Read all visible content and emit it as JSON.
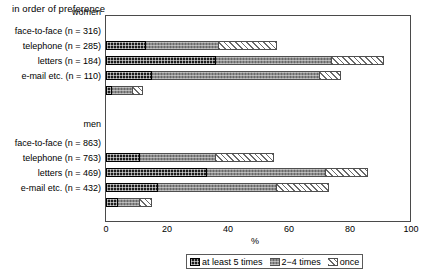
{
  "chart_title": "in order of preference",
  "xlabel": "%",
  "axis": {
    "ticks": [
      "0",
      "20",
      "40",
      "60",
      "80",
      "100"
    ],
    "xlim": [
      0,
      100
    ]
  },
  "legend": {
    "items": [
      {
        "label": "at least 5 times",
        "key": "at_least_5_times",
        "swatch": "dark-checker-swatch"
      },
      {
        "label": "2−4 times",
        "key": "2_4_times",
        "swatch": "gray-checker-swatch"
      },
      {
        "label": "once",
        "key": "once",
        "swatch": "white-hatch-swatch"
      }
    ]
  },
  "groups": [
    {
      "name": "women",
      "rows": [
        {
          "label": "face-to-face (n = 316)",
          "values": [
            13,
            24,
            19
          ]
        },
        {
          "label": "telephone (n = 285)",
          "values": [
            36,
            38,
            17
          ]
        },
        {
          "label": "letters (n = 184)",
          "values": [
            15,
            55,
            7
          ]
        },
        {
          "label": "e-mail etc. (n = 110)",
          "values": [
            2,
            7,
            3
          ]
        }
      ]
    },
    {
      "name": "men",
      "rows": [
        {
          "label": "face-to-face (n = 863)",
          "values": [
            11,
            25,
            19
          ]
        },
        {
          "label": "telephone (n = 763)",
          "values": [
            33,
            39,
            14
          ]
        },
        {
          "label": "letters (n = 469)",
          "values": [
            17,
            39,
            17
          ]
        },
        {
          "label": "e-mail etc. (n = 432)",
          "values": [
            4,
            7,
            4
          ]
        }
      ]
    }
  ],
  "chart_data": {
    "type": "bar",
    "orientation": "horizontal",
    "stacked": true,
    "title": "in order of preference",
    "xlabel": "%",
    "ylabel": "",
    "xlim": [
      0,
      100
    ],
    "xticks": [
      0,
      20,
      40,
      60,
      80,
      100
    ],
    "grid": false,
    "legend_position": "bottom",
    "categories": [
      "women: face-to-face (n = 316)",
      "women: telephone (n = 285)",
      "women: letters (n = 184)",
      "women: e-mail etc. (n = 110)",
      "men: face-to-face (n = 863)",
      "men: telephone (n = 763)",
      "men: letters (n = 469)",
      "men: e-mail etc. (n = 432)"
    ],
    "series": [
      {
        "name": "at least 5 times",
        "values": [
          13,
          36,
          15,
          2,
          11,
          33,
          17,
          4
        ]
      },
      {
        "name": "2−4 times",
        "values": [
          24,
          38,
          55,
          7,
          25,
          39,
          39,
          7
        ]
      },
      {
        "name": "once",
        "values": [
          19,
          17,
          7,
          3,
          19,
          14,
          17,
          4
        ]
      }
    ],
    "totals": [
      56,
      91,
      77,
      12,
      55,
      86,
      73,
      15
    ]
  }
}
